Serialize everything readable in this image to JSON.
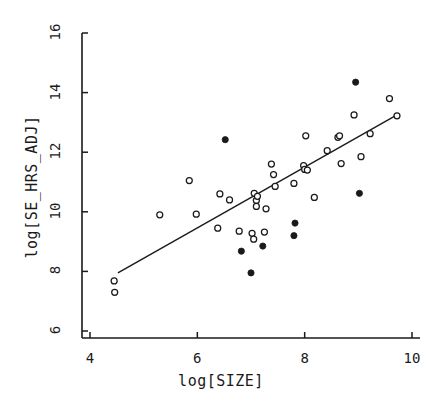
{
  "chart_data": {
    "type": "scatter",
    "title": "",
    "xlabel": "log[SIZE]",
    "ylabel": "log[SE_HRS_ADJ]",
    "xlim": [
      3.75,
      10.3
    ],
    "ylim": [
      6,
      16.4
    ],
    "xticks": [
      4,
      6,
      8,
      10
    ],
    "yticks": [
      6,
      8,
      10,
      12,
      14,
      16
    ],
    "xtick_labels": [
      "4",
      "6",
      "8",
      "10"
    ],
    "ytick_labels": [
      "6",
      "8",
      "10",
      "12",
      "14",
      "16"
    ],
    "grid": false,
    "legend": "none",
    "marker_colors": {
      "open": "#ffffff",
      "edge": "#1a1a1a",
      "filled": "#1a1a1a"
    },
    "series": [
      {
        "name": "open",
        "marker": "open-circle",
        "points": [
          [
            4.45,
            7.68
          ],
          [
            4.46,
            7.3
          ],
          [
            5.3,
            9.9
          ],
          [
            5.85,
            11.05
          ],
          [
            5.98,
            9.92
          ],
          [
            6.38,
            9.45
          ],
          [
            6.42,
            10.6
          ],
          [
            6.6,
            10.4
          ],
          [
            6.78,
            9.35
          ],
          [
            7.02,
            9.28
          ],
          [
            7.05,
            9.08
          ],
          [
            7.06,
            10.62
          ],
          [
            7.1,
            10.38
          ],
          [
            7.12,
            10.52
          ],
          [
            7.1,
            10.18
          ],
          [
            7.25,
            9.32
          ],
          [
            7.28,
            10.1
          ],
          [
            7.38,
            11.6
          ],
          [
            7.42,
            11.25
          ],
          [
            7.45,
            10.85
          ],
          [
            7.8,
            10.95
          ],
          [
            7.98,
            11.55
          ],
          [
            8.0,
            11.42
          ],
          [
            8.02,
            12.55
          ],
          [
            8.05,
            11.4
          ],
          [
            8.18,
            10.48
          ],
          [
            8.42,
            12.05
          ],
          [
            8.62,
            12.5
          ],
          [
            8.65,
            12.55
          ],
          [
            8.68,
            11.62
          ],
          [
            8.92,
            13.25
          ],
          [
            9.05,
            11.85
          ],
          [
            9.22,
            12.62
          ],
          [
            9.58,
            13.8
          ],
          [
            9.72,
            13.22
          ]
        ]
      },
      {
        "name": "filled",
        "marker": "filled-circle",
        "points": [
          [
            6.52,
            12.42
          ],
          [
            6.82,
            8.68
          ],
          [
            7.0,
            7.95
          ],
          [
            7.22,
            8.85
          ],
          [
            7.8,
            9.2
          ],
          [
            7.82,
            9.62
          ],
          [
            8.95,
            14.35
          ],
          [
            9.02,
            10.62
          ]
        ]
      }
    ],
    "fit_line": {
      "name": "regression-line",
      "x_start": 4.52,
      "y_start": 7.95,
      "x_end": 9.72,
      "y_end": 13.25,
      "color": "#1a1a1a"
    }
  }
}
